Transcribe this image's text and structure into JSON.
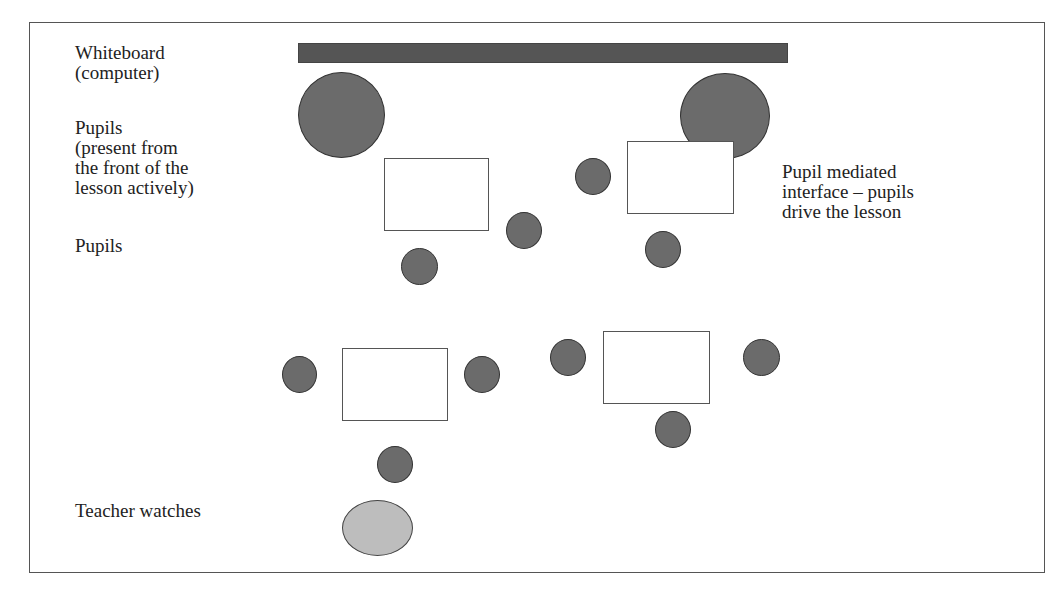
{
  "labels": {
    "whiteboard": "Whiteboard\n(computer)",
    "pupils_front": "Pupils\n(present from\nthe front of the\nlesson actively)",
    "pupils": "Pupils",
    "interface": "Pupil mediated\ninterface – pupils\ndrive the lesson",
    "teacher": "Teacher watches"
  },
  "colors": {
    "whiteboard": "#555555",
    "pupil": "#6b6b6b",
    "teacher": "#bdbdbd",
    "table": "#ffffff"
  },
  "shapes": {
    "whiteboard": {
      "x": 298,
      "y": 43,
      "w": 490,
      "h": 20
    },
    "front_pupils": [
      {
        "x": 298,
        "y": 72,
        "w": 87,
        "h": 86
      },
      {
        "x": 680,
        "y": 73,
        "w": 90,
        "h": 86
      }
    ],
    "tables": [
      {
        "x": 384,
        "y": 158,
        "w": 105,
        "h": 73
      },
      {
        "x": 627,
        "y": 141,
        "w": 107,
        "h": 73
      },
      {
        "x": 342,
        "y": 348,
        "w": 106,
        "h": 73
      },
      {
        "x": 603,
        "y": 331,
        "w": 107,
        "h": 73
      }
    ],
    "pupils": [
      {
        "x": 575,
        "y": 158,
        "w": 36,
        "h": 37
      },
      {
        "x": 506,
        "y": 212,
        "w": 36,
        "h": 37
      },
      {
        "x": 645,
        "y": 231,
        "w": 36,
        "h": 37
      },
      {
        "x": 401,
        "y": 248,
        "w": 37,
        "h": 37
      },
      {
        "x": 282,
        "y": 356,
        "w": 35,
        "h": 37
      },
      {
        "x": 464,
        "y": 356,
        "w": 36,
        "h": 37
      },
      {
        "x": 550,
        "y": 339,
        "w": 36,
        "h": 37
      },
      {
        "x": 743,
        "y": 339,
        "w": 37,
        "h": 37
      },
      {
        "x": 655,
        "y": 411,
        "w": 36,
        "h": 37
      },
      {
        "x": 377,
        "y": 446,
        "w": 36,
        "h": 37
      }
    ],
    "teacher": {
      "x": 342,
      "y": 500,
      "w": 71,
      "h": 56
    }
  }
}
